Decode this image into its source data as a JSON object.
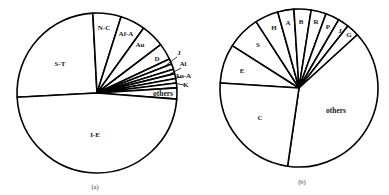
{
  "chart_data": [
    {
      "type": "pie",
      "title": "",
      "caption": "(a)",
      "center": [
        97,
        93
      ],
      "radius": 80,
      "start_angle": 267,
      "slices": [
        {
          "label": "S-T",
          "degrees": 90.0,
          "percent": 25.0
        },
        {
          "label": "N-C",
          "degrees": 20.5,
          "percent": 5.7
        },
        {
          "label": "Af-A",
          "degrees": 18.2,
          "percent": 5.1
        },
        {
          "label": "Au",
          "degrees": 17.1,
          "percent": 4.7
        },
        {
          "label": "D",
          "degrees": 12.0,
          "percent": 3.3
        },
        {
          "label": "J",
          "degrees": 4.0,
          "percent": 1.1
        },
        {
          "label": "Al",
          "degrees": 4.0,
          "percent": 1.1
        },
        {
          "label": "",
          "degrees": 3.2,
          "percent": 0.9
        },
        {
          "label": "Au-A",
          "degrees": 3.5,
          "percent": 1.0
        },
        {
          "label": "K",
          "degrees": 3.3,
          "percent": 0.9
        },
        {
          "label": "",
          "degrees": 3.5,
          "percent": 1.0
        },
        {
          "label": "others",
          "degrees": 8.1,
          "percent": 2.3
        },
        {
          "label": "I-E",
          "degrees": 172.6,
          "percent": 47.9
        }
      ]
    },
    {
      "type": "pie",
      "title": "",
      "caption": "(b)",
      "center": [
        299,
        88
      ],
      "radius": 79,
      "start_angle": 273.6,
      "slices": [
        {
          "label": "E",
          "degrees": 28.9,
          "percent": 8.0
        },
        {
          "label": "S",
          "degrees": 24.6,
          "percent": 6.8
        },
        {
          "label": "H",
          "degrees": 17.3,
          "percent": 4.8
        },
        {
          "label": "A",
          "degrees": 11.9,
          "percent": 3.3
        },
        {
          "label": "B",
          "degrees": 12.6,
          "percent": 3.5
        },
        {
          "label": "R",
          "degrees": 11.1,
          "percent": 3.1
        },
        {
          "label": "P",
          "degrees": 10.2,
          "percent": 2.8
        },
        {
          "label": "J",
          "degrees": 8.0,
          "percent": 2.2
        },
        {
          "label": "G",
          "degrees": 9.4,
          "percent": 2.6
        },
        {
          "label": "others",
          "degrees": 140.7,
          "percent": 39.1
        },
        {
          "label": "C",
          "degrees": 85.3,
          "percent": 23.7
        }
      ]
    }
  ],
  "labels_a": [
    {
      "text": "S-T",
      "x": 60,
      "y": 66
    },
    {
      "text": "N-C",
      "x": 104,
      "y": 30
    },
    {
      "text": "Af-A",
      "x": 126,
      "y": 36
    },
    {
      "text": "Au",
      "x": 140,
      "y": 47
    },
    {
      "text": "D",
      "x": 157,
      "y": 61
    },
    {
      "text": "J",
      "x": 179,
      "y": 55
    },
    {
      "text": "Al",
      "x": 183,
      "y": 66
    },
    {
      "text": "Au-A",
      "x": 183,
      "y": 78
    },
    {
      "text": "K",
      "x": 186,
      "y": 87
    },
    {
      "text": "others",
      "x": 163,
      "y": 96
    },
    {
      "text": "I-E",
      "x": 95,
      "y": 137
    },
    {
      "text": "(a)",
      "x": 95,
      "y": 189
    }
  ],
  "labels_b": [
    {
      "text": "H",
      "x": 274,
      "y": 30
    },
    {
      "text": "A",
      "x": 288,
      "y": 25
    },
    {
      "text": "B",
      "x": 301,
      "y": 24
    },
    {
      "text": "R",
      "x": 316,
      "y": 24
    },
    {
      "text": "P",
      "x": 328,
      "y": 29
    },
    {
      "text": "J",
      "x": 340,
      "y": 33
    },
    {
      "text": "G",
      "x": 349,
      "y": 37
    },
    {
      "text": "S",
      "x": 258,
      "y": 47
    },
    {
      "text": "E",
      "x": 242,
      "y": 73
    },
    {
      "text": "C",
      "x": 260,
      "y": 120
    },
    {
      "text": "others",
      "x": 336,
      "y": 113
    },
    {
      "text": "(b)",
      "x": 302,
      "y": 184
    }
  ]
}
